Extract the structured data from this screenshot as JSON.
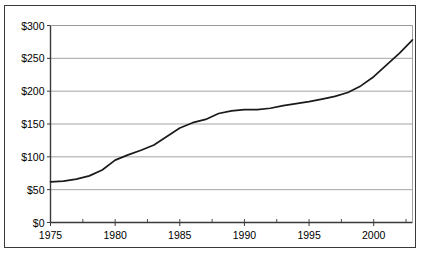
{
  "chart_data": {
    "type": "line",
    "title": "",
    "subtitle": "",
    "xlabel": "",
    "ylabel": "",
    "xlim": [
      1975,
      2003
    ],
    "ylim": [
      0,
      300
    ],
    "grid": true,
    "legend": null,
    "y_ticks": [
      0,
      50,
      100,
      150,
      200,
      250,
      300
    ],
    "y_tick_labels": [
      "$0",
      "$50",
      "$100",
      "$150",
      "$200",
      "$250",
      "$300"
    ],
    "x_ticks": [
      1975,
      1980,
      1985,
      1990,
      1995,
      2000
    ],
    "x_tick_labels": [
      "1975",
      "1980",
      "1985",
      "1990",
      "1995",
      "2000"
    ],
    "x_minor_tick_interval": 2.5,
    "line_color": "#1a1a1a",
    "grid_color": "#9a9a9a",
    "axis_color": "#3a3a3a",
    "series": [
      {
        "name": "Value",
        "x": [
          1975,
          1976,
          1977,
          1978,
          1979,
          1980,
          1981,
          1982,
          1983,
          1984,
          1985,
          1986,
          1987,
          1988,
          1989,
          1990,
          1991,
          1992,
          1993,
          1994,
          1995,
          1996,
          1997,
          1998,
          1999,
          2000,
          2001,
          2002,
          2003
        ],
        "values": [
          62,
          63,
          66,
          71,
          80,
          95,
          103,
          110,
          118,
          131,
          144,
          152,
          157,
          166,
          170,
          172,
          172,
          174,
          178,
          181,
          184,
          188,
          192,
          198,
          208,
          222,
          240,
          258,
          278
        ]
      }
    ]
  },
  "axes": {
    "y_axis_name": "dollar-axis",
    "x_axis_name": "year-axis"
  }
}
